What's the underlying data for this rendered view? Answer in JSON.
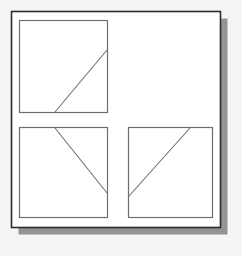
{
  "figure": {
    "canvas": {
      "width": 242,
      "height": 256,
      "background": "#f6f5f3"
    },
    "outer_frame": {
      "name": "outer-frame",
      "x": 11.5,
      "y": 11.5,
      "width": 209,
      "height": 216,
      "fill": "#ffffff",
      "stroke": "#2b2b2b",
      "stroke_width": 1.6
    },
    "drop_shadow": {
      "name": "drop-shadow",
      "x": 18.5,
      "y": 18.5,
      "width": 209,
      "height": 216,
      "fill": "#949494",
      "offset_x": 7,
      "offset_y": 7
    },
    "panels": [
      {
        "id": "panel-top-left",
        "label": "Top left panel",
        "x": 19.5,
        "y": 20.5,
        "width": 88,
        "height": 92,
        "fill": "#ffffff",
        "stroke": "#6e6e6e",
        "stroke_width": 1.2,
        "line": {
          "name": "diagonal-line",
          "x1": 55,
          "y1": 112,
          "x2": 107,
          "y2": 50,
          "stroke": "#6e6e6e",
          "stroke_width": 1.1,
          "description": "rises from bottom edge to right edge"
        }
      },
      {
        "id": "panel-bottom-left",
        "label": "Bottom left panel",
        "x": 19.5,
        "y": 127.5,
        "width": 88,
        "height": 90,
        "fill": "#ffffff",
        "stroke": "#6e6e6e",
        "stroke_width": 1.2,
        "line": {
          "name": "diagonal-line",
          "x1": 55,
          "y1": 128,
          "x2": 107,
          "y2": 193,
          "stroke": "#6e6e6e",
          "stroke_width": 1.1,
          "description": "falls from top edge to right edge"
        }
      },
      {
        "id": "panel-bottom-right",
        "label": "Bottom right panel",
        "x": 128.5,
        "y": 127.5,
        "width": 84,
        "height": 90,
        "fill": "#ffffff",
        "stroke": "#6e6e6e",
        "stroke_width": 1.2,
        "line": {
          "name": "diagonal-line",
          "x1": 129,
          "y1": 196,
          "x2": 190,
          "y2": 128,
          "stroke": "#6e6e6e",
          "stroke_width": 1.1,
          "description": "rises from left edge to top edge"
        }
      }
    ]
  }
}
